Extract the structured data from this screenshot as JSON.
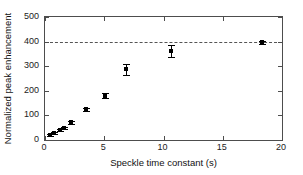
{
  "chart_data": {
    "type": "scatter",
    "title": "",
    "xlabel": "Speckle time constant (s)",
    "ylabel": "Normalized peak enhancement",
    "xlim": [
      0,
      20
    ],
    "ylim": [
      0,
      500
    ],
    "xticks": [
      0,
      5,
      10,
      15,
      20
    ],
    "yticks": [
      0,
      100,
      200,
      300,
      400,
      500
    ],
    "xticklabels": [
      "0",
      "5",
      "10",
      "15",
      "20"
    ],
    "yticklabels": [
      "0",
      "100",
      "200",
      "300",
      "400",
      "500"
    ],
    "grid": false,
    "legend": null,
    "marker_color": "#000000",
    "axis_color": "#4d4d4d",
    "background": "#ffffff",
    "annotations": [
      {
        "name": "asymptote",
        "kind": "horizontal-dashed-line",
        "y": 400,
        "color": "#555555",
        "label": ""
      }
    ],
    "series": [
      {
        "name": "Normalized peak enhancement",
        "marker": "square",
        "errorbars": true,
        "points": [
          {
            "x": 0.45,
            "y": 20,
            "yerr": 4
          },
          {
            "x": 0.8,
            "y": 28,
            "yerr": 4
          },
          {
            "x": 1.3,
            "y": 42,
            "yerr": 4
          },
          {
            "x": 1.6,
            "y": 48,
            "yerr": 4
          },
          {
            "x": 2.2,
            "y": 72,
            "yerr": 5
          },
          {
            "x": 3.5,
            "y": 125,
            "yerr": 6
          },
          {
            "x": 5.05,
            "y": 180,
            "yerr": 10
          },
          {
            "x": 6.8,
            "y": 288,
            "yerr": 22
          },
          {
            "x": 10.6,
            "y": 362,
            "yerr": 25
          },
          {
            "x": 18.3,
            "y": 397,
            "yerr": 6
          }
        ]
      }
    ]
  }
}
